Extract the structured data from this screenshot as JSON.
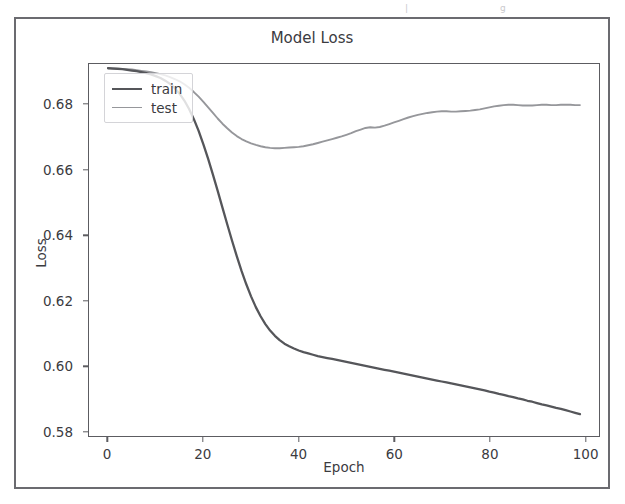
{
  "figure": {
    "scan_artifact_fragments": [
      "|",
      "g"
    ]
  },
  "chart_data": {
    "type": "line",
    "title": "Model Loss",
    "xlabel": "Epoch",
    "ylabel": "Loss",
    "xlim": [
      -4,
      103
    ],
    "ylim": [
      0.5785,
      0.6925
    ],
    "grid": false,
    "legend_position": "upper left",
    "xticks": [
      0,
      20,
      40,
      60,
      80,
      100
    ],
    "xtick_labels": [
      "0",
      "20",
      "40",
      "60",
      "80",
      "100"
    ],
    "yticks": [
      0.58,
      0.6,
      0.62,
      0.64,
      0.66,
      0.68
    ],
    "ytick_labels": [
      "0.58",
      "0.60",
      "0.62",
      "0.64",
      "0.66",
      "0.68"
    ],
    "colors": {
      "train": "#55565a",
      "test": "#96979b"
    },
    "x": [
      0,
      1,
      2,
      3,
      4,
      5,
      6,
      7,
      8,
      9,
      10,
      11,
      12,
      13,
      14,
      15,
      16,
      17,
      18,
      19,
      20,
      21,
      22,
      23,
      24,
      25,
      26,
      27,
      28,
      29,
      30,
      31,
      32,
      33,
      34,
      35,
      36,
      37,
      38,
      39,
      40,
      41,
      42,
      43,
      44,
      45,
      46,
      47,
      48,
      49,
      50,
      51,
      52,
      53,
      54,
      55,
      56,
      57,
      58,
      59,
      60,
      61,
      62,
      63,
      64,
      65,
      66,
      67,
      68,
      69,
      70,
      71,
      72,
      73,
      74,
      75,
      76,
      77,
      78,
      79,
      80,
      81,
      82,
      83,
      84,
      85,
      86,
      87,
      88,
      89,
      90,
      91,
      92,
      93,
      94,
      95,
      96,
      97,
      98,
      99
    ],
    "series": [
      {
        "name": "train",
        "values": [
          0.6912,
          0.6911,
          0.691,
          0.6909,
          0.6907,
          0.6905,
          0.6903,
          0.69,
          0.6897,
          0.6893,
          0.6888,
          0.6882,
          0.6874,
          0.6864,
          0.6851,
          0.6834,
          0.6813,
          0.6787,
          0.6756,
          0.672,
          0.6679,
          0.6634,
          0.6586,
          0.6536,
          0.6485,
          0.6434,
          0.6384,
          0.6336,
          0.6291,
          0.625,
          0.6213,
          0.618,
          0.6152,
          0.6128,
          0.6108,
          0.6092,
          0.6079,
          0.6068,
          0.606,
          0.6053,
          0.6047,
          0.6042,
          0.6038,
          0.6034,
          0.603,
          0.6027,
          0.6024,
          0.6021,
          0.6018,
          0.6015,
          0.6012,
          0.6009,
          0.6006,
          0.6003,
          0.6,
          0.5997,
          0.5994,
          0.5991,
          0.5988,
          0.5985,
          0.5982,
          0.5979,
          0.5976,
          0.5973,
          0.597,
          0.5967,
          0.5964,
          0.5961,
          0.5958,
          0.5955,
          0.5952,
          0.5949,
          0.5946,
          0.5943,
          0.594,
          0.5937,
          0.5934,
          0.5931,
          0.5928,
          0.5925,
          0.5921,
          0.5918,
          0.5914,
          0.5911,
          0.5907,
          0.5904,
          0.59,
          0.5897,
          0.5893,
          0.589,
          0.5886,
          0.5882,
          0.5879,
          0.5875,
          0.5871,
          0.5868,
          0.5864,
          0.586,
          0.5856,
          0.5852
        ]
      },
      {
        "name": "test",
        "values": [
          0.6913,
          0.6912,
          0.6911,
          0.691,
          0.6909,
          0.6908,
          0.6906,
          0.6904,
          0.6902,
          0.69,
          0.6897,
          0.6894,
          0.689,
          0.6885,
          0.6879,
          0.6872,
          0.6863,
          0.6852,
          0.6839,
          0.6825,
          0.6809,
          0.6792,
          0.6775,
          0.6758,
          0.6742,
          0.6728,
          0.6715,
          0.6704,
          0.6695,
          0.6688,
          0.6682,
          0.6677,
          0.6673,
          0.667,
          0.6668,
          0.6667,
          0.6667,
          0.6668,
          0.6669,
          0.667,
          0.6671,
          0.6673,
          0.6676,
          0.6679,
          0.6683,
          0.6687,
          0.6691,
          0.6695,
          0.6699,
          0.6703,
          0.6708,
          0.6713,
          0.6719,
          0.6724,
          0.6729,
          0.6731,
          0.673,
          0.6732,
          0.6736,
          0.6741,
          0.6746,
          0.6751,
          0.6756,
          0.6761,
          0.6765,
          0.6769,
          0.6772,
          0.6775,
          0.6777,
          0.6779,
          0.678,
          0.678,
          0.6779,
          0.6779,
          0.678,
          0.6781,
          0.6782,
          0.6784,
          0.6786,
          0.6789,
          0.6792,
          0.6795,
          0.6797,
          0.6799,
          0.68,
          0.68,
          0.6799,
          0.6798,
          0.6798,
          0.6798,
          0.6799,
          0.68,
          0.68,
          0.6799,
          0.6799,
          0.68,
          0.68,
          0.68,
          0.6799,
          0.6799
        ]
      }
    ],
    "legend_entries": [
      "train",
      "test"
    ]
  }
}
